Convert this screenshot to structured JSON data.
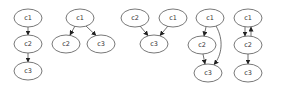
{
  "diagram": {
    "type": "directed-graphs",
    "graphs": [
      {
        "id": "graph-1",
        "nodes": [
          {
            "label": "c1",
            "cx": 28,
            "cy": 18
          },
          {
            "label": "c2",
            "cx": 28,
            "cy": 44
          },
          {
            "label": "c3",
            "cx": 28,
            "cy": 71
          }
        ],
        "edges": [
          {
            "from": "c1",
            "to": "c2"
          },
          {
            "from": "c2",
            "to": "c3"
          }
        ]
      },
      {
        "id": "graph-2",
        "nodes": [
          {
            "label": "c1",
            "cx": 80,
            "cy": 18
          },
          {
            "label": "c2",
            "cx": 66,
            "cy": 44
          },
          {
            "label": "c3",
            "cx": 101,
            "cy": 44
          }
        ],
        "edges": [
          {
            "from": "c1",
            "to": "c2"
          },
          {
            "from": "c1",
            "to": "c3"
          }
        ]
      },
      {
        "id": "graph-3",
        "nodes": [
          {
            "label": "c2",
            "cx": 135,
            "cy": 18
          },
          {
            "label": "c1",
            "cx": 173,
            "cy": 18
          },
          {
            "label": "c3",
            "cx": 154,
            "cy": 44
          }
        ],
        "edges": [
          {
            "from": "c2",
            "to": "c3"
          },
          {
            "from": "c1",
            "to": "c3"
          }
        ]
      },
      {
        "id": "graph-4",
        "nodes": [
          {
            "label": "c1",
            "cx": 210,
            "cy": 18
          },
          {
            "label": "c2",
            "cx": 202,
            "cy": 45
          },
          {
            "label": "c3",
            "cx": 208,
            "cy": 73
          }
        ],
        "edges": [
          {
            "from": "c1",
            "to": "c2"
          },
          {
            "from": "c2",
            "to": "c3"
          },
          {
            "from": "c1",
            "to": "c3"
          }
        ]
      },
      {
        "id": "graph-5",
        "nodes": [
          {
            "label": "c1",
            "cx": 248,
            "cy": 18
          },
          {
            "label": "c2",
            "cx": 248,
            "cy": 45
          },
          {
            "label": "c3",
            "cx": 248,
            "cy": 73
          }
        ],
        "edges": [
          {
            "from": "c1",
            "to": "c2"
          },
          {
            "from": "c2",
            "to": "c1"
          },
          {
            "from": "c2",
            "to": "c3"
          }
        ]
      }
    ]
  },
  "labels": {
    "g1": {
      "n1": "c1",
      "n2": "c2",
      "n3": "c3"
    },
    "g2": {
      "n1": "c1",
      "n2": "c2",
      "n3": "c3"
    },
    "g3": {
      "n1": "c2",
      "n2": "c1",
      "n3": "c3"
    },
    "g4": {
      "n1": "c1",
      "n2": "c2",
      "n3": "c3"
    },
    "g5": {
      "n1": "c1",
      "n2": "c2",
      "n3": "c3"
    }
  }
}
